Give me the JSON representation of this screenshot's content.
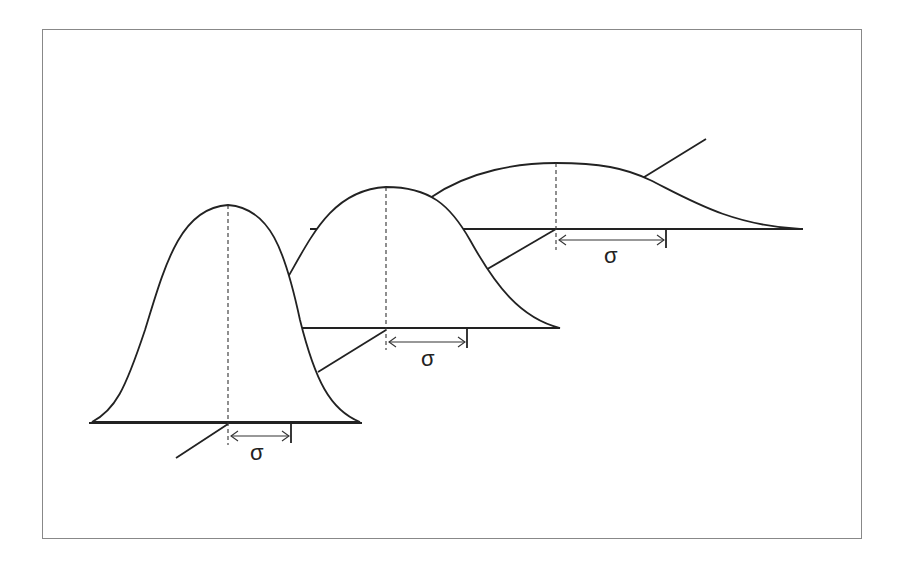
{
  "diagram": {
    "colors": {
      "line": "#222222",
      "frame": "#888888",
      "background": "#ffffff"
    },
    "curves": [
      {
        "label": "σ",
        "mean_x": 228,
        "baseline_y": 423,
        "peak_y": 205,
        "sigma_px": 64
      },
      {
        "label": "σ",
        "mean_x": 386,
        "baseline_y": 328,
        "peak_y": 187,
        "sigma_px": 82
      },
      {
        "label": "σ",
        "mean_x": 556,
        "baseline_y": 229,
        "peak_y": 163,
        "sigma_px": 110
      }
    ]
  }
}
